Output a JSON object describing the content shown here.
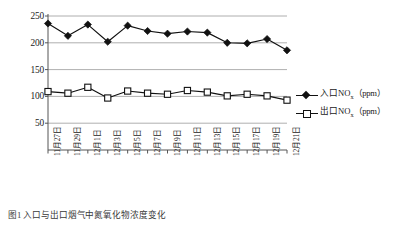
{
  "chart_data": {
    "type": "line",
    "title": "",
    "xlabel": "",
    "ylabel": "",
    "ylim": [
      0,
      250
    ],
    "yticks": [
      50,
      100,
      150,
      200,
      250
    ],
    "grid": true,
    "legend_position": "right",
    "categories": [
      "11月27日",
      "11月29日",
      "12月1日",
      "12月3日",
      "12月5日",
      "12月7日",
      "12月9日",
      "12月11日",
      "12月13日",
      "12月15日",
      "12月17日",
      "12月19日",
      "12月21日"
    ],
    "series": [
      {
        "name": "入口NOx（ppm）",
        "marker": "filled-diamond",
        "values": [
          236,
          213,
          234,
          202,
          232,
          222,
          217,
          221,
          219,
          200,
          199,
          207,
          186
        ]
      },
      {
        "name": "出口NOx（ppm）",
        "marker": "open-square",
        "values": [
          109,
          106,
          117,
          97,
          110,
          106,
          104,
          111,
          108,
          101,
          104,
          101,
          93
        ]
      }
    ]
  },
  "legend": {
    "entries": [
      {
        "text_main": "入口NO",
        "text_sub": "x",
        "text_unit": "（ppm）",
        "marker": "filled-diamond",
        "color": "#111111"
      },
      {
        "text_main": "出口NO",
        "text_sub": "x",
        "text_unit": "（ppm）",
        "marker": "open-square",
        "color": "#111111"
      }
    ]
  },
  "axes": {
    "y_tick_labels": [
      "250",
      "200",
      "150",
      "100",
      "50"
    ],
    "x_tick_labels": [
      "11月27日",
      "11月29日",
      "12月1日",
      "12月3日",
      "12月5日",
      "12月7日",
      "12月9日",
      "12月11日",
      "12月13日",
      "12月15日",
      "12月17日",
      "12月19日",
      "12月21日"
    ]
  },
  "caption": {
    "text": "图1  入口与出口烟气中氮氧化物浓度变化"
  },
  "colors": {
    "series_line": "#111111",
    "gridline": "#9a9a9a",
    "axis": "#555555",
    "background": "#ffffff"
  }
}
